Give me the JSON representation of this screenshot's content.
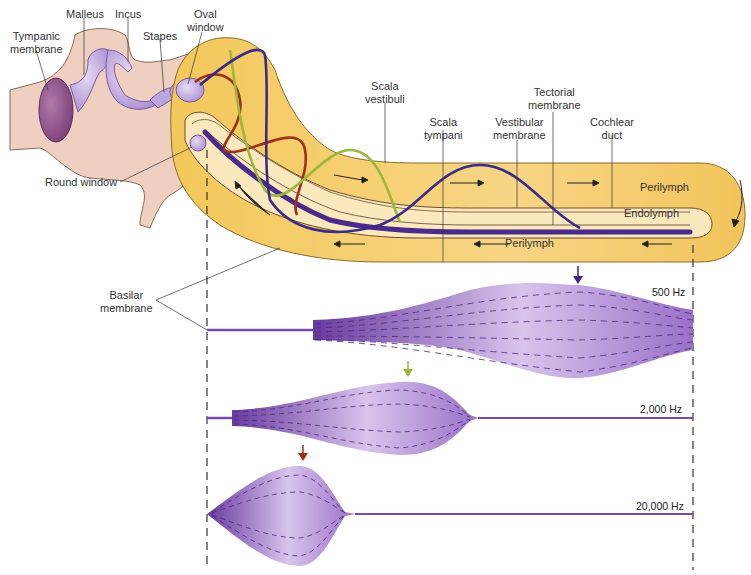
{
  "figure": {
    "labels": {
      "malleus": "Malleus",
      "incus": "Incus",
      "stapes": "Stapes",
      "oval_window": "Oval\nwindow",
      "tympanic_membrane": "Tympanic\nmembrane",
      "round_window": "Round window",
      "scala_vestibuli": "Scala\nvestibuli",
      "scala_tympani": "Scala\ntympani",
      "vestibular_membrane": "Vestibular\nmembrane",
      "tectorial_membrane": "Tectorial\nmembrane",
      "cochlear_duct": "Cochlear\nduct",
      "perilymph_top": "Perilymph",
      "endolymph": "Endolymph",
      "perilymph_bottom": "Perilymph",
      "basilar_membrane": "Basilar\nmembrane"
    },
    "frequencies": [
      {
        "label": "500 Hz",
        "arrow_color": "#3a2a8a",
        "peak_position": "near apex"
      },
      {
        "label": "2,000 Hz",
        "arrow_color": "#9ab83a",
        "peak_position": "middle"
      },
      {
        "label": "20,000 Hz",
        "arrow_color": "#a0301a",
        "peak_position": "near base"
      }
    ],
    "colors": {
      "cochlea_fill": "#f6cf6a",
      "cochlea_inner": "#fbe7b6",
      "bone_fill": "#e8c8b8",
      "ossicle_fill": "#c9b0e0",
      "basilar_purple": "#6b3fa0",
      "wave_blue": "#3a2a8a",
      "wave_green": "#9ab83a",
      "wave_red": "#a0301a"
    }
  }
}
